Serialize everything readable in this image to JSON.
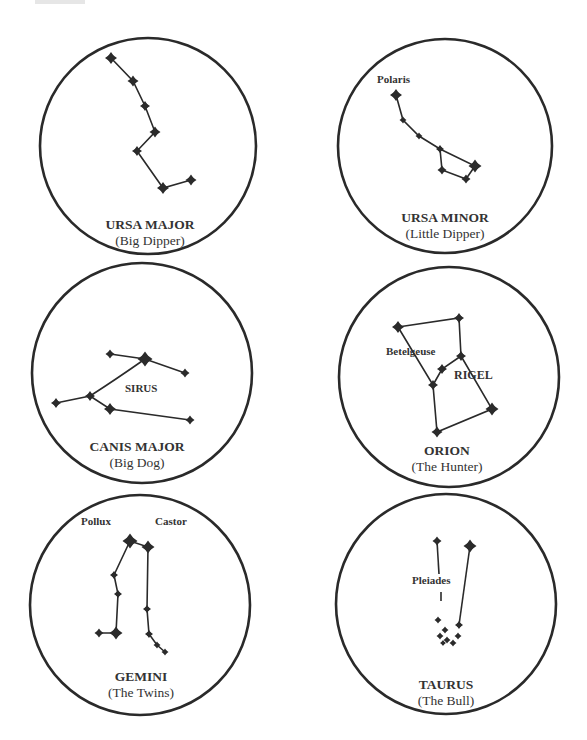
{
  "diagram": {
    "colors": {
      "ink": "#2b2b2b",
      "background": "#ffffff"
    },
    "constellations": [
      {
        "id": "ursa-major",
        "name": "URSA MAJOR",
        "common_name": "(Big Dipper)",
        "star_labels": [],
        "star_count": 7
      },
      {
        "id": "ursa-minor",
        "name": "URSA MINOR",
        "common_name": "(Little Dipper)",
        "star_labels": [
          "Polaris"
        ],
        "star_count": 7
      },
      {
        "id": "canis-major",
        "name": "CANIS MAJOR",
        "common_name": "(Big Dog)",
        "star_labels": [
          "SIRUS"
        ],
        "star_count": 7
      },
      {
        "id": "orion",
        "name": "ORION",
        "common_name": "(The Hunter)",
        "star_labels": [
          "Betelgeuse",
          "RIGEL"
        ],
        "star_count": 7
      },
      {
        "id": "gemini",
        "name": "GEMINI",
        "common_name": "(The Twins)",
        "star_labels": [
          "Pollux",
          "Castor"
        ],
        "star_count": 10
      },
      {
        "id": "taurus",
        "name": "TAURUS",
        "common_name": "(The Bull)",
        "star_labels": [
          "Pleiades"
        ],
        "star_count": 10
      }
    ]
  }
}
